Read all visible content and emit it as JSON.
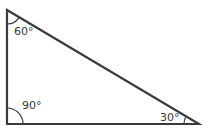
{
  "diagram": {
    "type": "right-triangle",
    "stroke_color": "#3a3a3a",
    "vertices": {
      "top": {
        "x": 7,
        "y": 10
      },
      "right_angle": {
        "x": 7,
        "y": 124
      },
      "right": {
        "x": 199,
        "y": 124
      }
    },
    "angles": {
      "top": {
        "label": "60°",
        "degrees": 60
      },
      "bottom_left": {
        "label": "90°",
        "degrees": 90
      },
      "bottom_right": {
        "label": "30°",
        "degrees": 30
      }
    }
  }
}
